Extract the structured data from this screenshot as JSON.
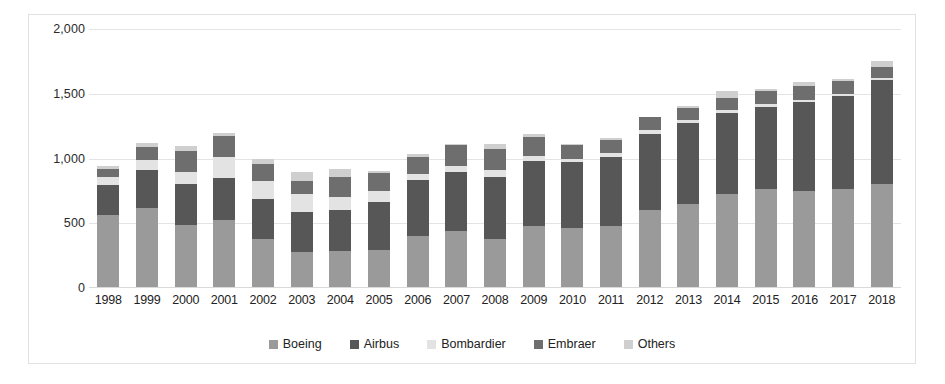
{
  "chart_data": {
    "type": "bar",
    "stacked": true,
    "title": "",
    "subtitle": "",
    "xlabel": "",
    "ylabel": "",
    "ylim": [
      0,
      2000
    ],
    "ytick_values": [
      0,
      500,
      1000,
      1500,
      2000
    ],
    "ytick_labels": [
      "0",
      "500",
      "1,000",
      "1,500",
      "2,000"
    ],
    "grid": true,
    "legend_position": "bottom-center",
    "categories": [
      "1998",
      "1999",
      "2000",
      "2001",
      "2002",
      "2003",
      "2004",
      "2005",
      "2006",
      "2007",
      "2008",
      "2009",
      "2010",
      "2011",
      "2012",
      "2013",
      "2014",
      "2015",
      "2016",
      "2017",
      "2018"
    ],
    "series": [
      {
        "name": "Boeing",
        "color": "#9a9a9a",
        "values": [
          563,
          620,
          489,
          527,
          381,
          281,
          285,
          290,
          398,
          441,
          375,
          481,
          462,
          477,
          601,
          648,
          723,
          762,
          748,
          763,
          806
        ]
      },
      {
        "name": "Airbus",
        "color": "#575757",
        "values": [
          229,
          294,
          311,
          325,
          303,
          305,
          320,
          378,
          434,
          453,
          483,
          498,
          510,
          534,
          588,
          626,
          629,
          635,
          688,
          718,
          800
        ]
      },
      {
        "name": "Bombardier",
        "color": "#e3e3e3",
        "values": [
          67,
          78,
          99,
          161,
          139,
          143,
          101,
          83,
          47,
          46,
          50,
          40,
          26,
          30,
          29,
          26,
          23,
          21,
          18,
          16,
          12
        ]
      },
      {
        "name": "Embraer",
        "color": "#6e6e6e",
        "values": [
          60,
          97,
          160,
          161,
          131,
          101,
          148,
          141,
          130,
          162,
          162,
          151,
          106,
          105,
          106,
          90,
          92,
          101,
          108,
          101,
          90
        ]
      },
      {
        "name": "Others",
        "color": "#cfcfcf",
        "values": [
          26,
          31,
          36,
          21,
          39,
          66,
          68,
          13,
          27,
          11,
          39,
          16,
          8,
          14,
          0,
          19,
          52,
          18,
          32,
          20,
          47
        ]
      }
    ]
  },
  "legend": {
    "items": [
      {
        "label": "Boeing",
        "color": "#9a9a9a"
      },
      {
        "label": "Airbus",
        "color": "#575757"
      },
      {
        "label": "Bombardier",
        "color": "#e3e3e3"
      },
      {
        "label": "Embraer",
        "color": "#6e6e6e"
      },
      {
        "label": "Others",
        "color": "#cfcfcf"
      }
    ]
  }
}
